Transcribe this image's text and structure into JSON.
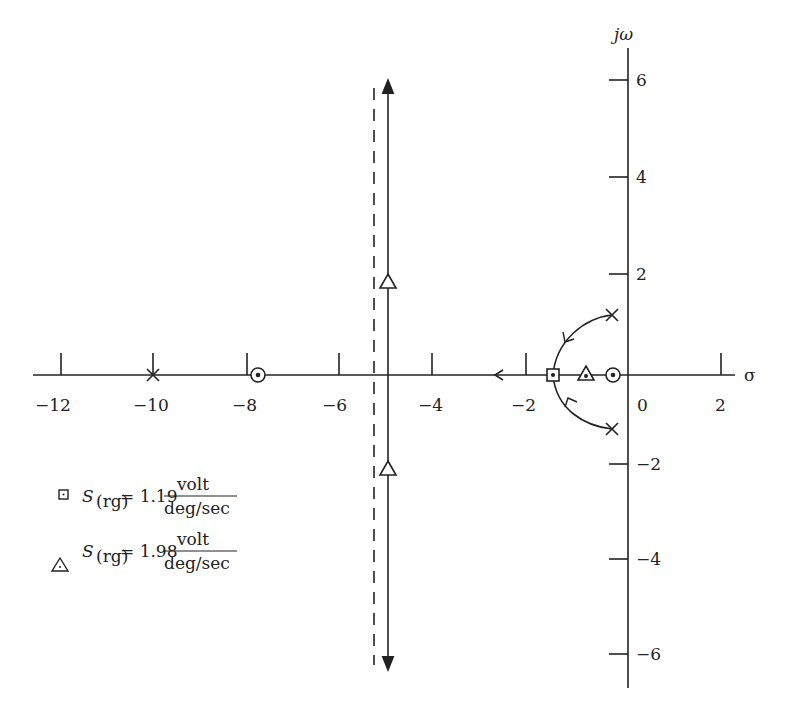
{
  "diagram": {
    "type": "root-locus",
    "axes": {
      "x_label": "σ",
      "y_label": "jω",
      "x_ticks": [
        {
          "value": -12,
          "label": "−12",
          "px": 61
        },
        {
          "value": -10,
          "label": "−10",
          "px": 153
        },
        {
          "value": -8,
          "label": "−8",
          "px": 247
        },
        {
          "value": -6,
          "label": "−6",
          "px": 339
        },
        {
          "value": -4,
          "label": "−4",
          "px": 432
        },
        {
          "value": -2,
          "label": "−2",
          "px": 526
        },
        {
          "value": 0,
          "label": "0",
          "px": 628
        },
        {
          "value": 2,
          "label": "2",
          "px": 721
        }
      ],
      "y_ticks": [
        {
          "value": 6,
          "label": "6",
          "py": 80
        },
        {
          "value": 4,
          "label": "4",
          "py": 177
        },
        {
          "value": 2,
          "label": "2",
          "py": 274
        },
        {
          "value": -2,
          "label": "−2",
          "py": 464
        },
        {
          "value": -4,
          "label": "−4",
          "py": 559
        },
        {
          "value": -6,
          "label": "−6",
          "py": 654
        }
      ]
    },
    "poles": [
      {
        "sigma": -10,
        "omega": 0
      },
      {
        "sigma": -0.7,
        "omega": 1.2
      },
      {
        "sigma": -0.7,
        "omega": -1.2
      }
    ],
    "zeros": [
      {
        "sigma": -7.6,
        "omega": 0
      },
      {
        "sigma": -0.7,
        "omega": 0
      }
    ],
    "asymptote_sigma": -5.3,
    "markers": [
      {
        "symbol": "square",
        "sigma": -1.5,
        "omega": 0
      },
      {
        "symbol": "triangle",
        "sigma": -0.95,
        "omega": 0
      },
      {
        "symbol": "triangle",
        "sigma": -5,
        "omega": 1.9
      },
      {
        "symbol": "triangle",
        "sigma": -5,
        "omega": -1.9
      }
    ],
    "legend": [
      {
        "symbol": "square",
        "var": "S",
        "sub": "(rg)",
        "eq": "= 1.19",
        "num": "volt",
        "den": "deg/sec"
      },
      {
        "symbol": "triangle",
        "var": "S",
        "sub": "(rg)",
        "eq": "= 1.98",
        "num": "volt",
        "den": "deg/sec"
      }
    ]
  }
}
